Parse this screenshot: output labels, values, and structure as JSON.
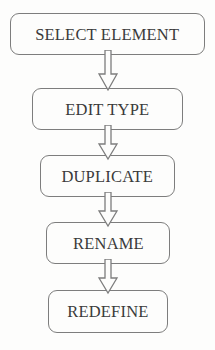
{
  "diagram": {
    "orientation": "vertical-top-to-bottom",
    "stroke_color": "#7d7d7d",
    "text_color": "#3a3a3a",
    "background_color": "#fdfdfc",
    "nodes": [
      {
        "id": "select-element",
        "label": "SELECT ELEMENT",
        "x": 10,
        "y": 13,
        "width": 195,
        "height": 42
      },
      {
        "id": "edit-type",
        "label": "EDIT TYPE",
        "x": 32,
        "y": 88,
        "width": 151,
        "height": 42
      },
      {
        "id": "duplicate",
        "label": "DUPLICATE",
        "x": 40,
        "y": 155,
        "width": 135,
        "height": 42
      },
      {
        "id": "rename",
        "label": "RENAME",
        "x": 46,
        "y": 222,
        "width": 124,
        "height": 42
      },
      {
        "id": "redefine",
        "label": "REDEFINE",
        "x": 48,
        "y": 290,
        "width": 120,
        "height": 43
      }
    ],
    "connectors": [
      {
        "id": "arrow-select-to-edit",
        "from": "select-element",
        "to": "edit-type",
        "shape": "hollow-block-arrow",
        "direction": "down"
      },
      {
        "id": "arrow-edit-to-duplicate",
        "from": "edit-type",
        "to": "duplicate",
        "shape": "hollow-block-arrow",
        "direction": "down"
      },
      {
        "id": "arrow-duplicate-to-rename",
        "from": "duplicate",
        "to": "rename",
        "shape": "hollow-block-arrow",
        "direction": "down"
      },
      {
        "id": "arrow-rename-to-redefine",
        "from": "rename",
        "to": "redefine",
        "shape": "hollow-block-arrow",
        "direction": "down"
      }
    ]
  }
}
